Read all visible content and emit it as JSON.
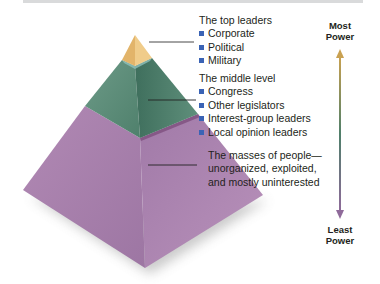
{
  "diagram": {
    "type": "power-elite-pyramid",
    "tiers": [
      {
        "id": "top",
        "heading": "The top leaders",
        "items": [
          "Corporate",
          "Political",
          "Military"
        ],
        "color": "#d9a85a"
      },
      {
        "id": "middle",
        "heading": "The middle level",
        "items": [
          "Congress",
          "Other legislators",
          "Interest-group leaders",
          "Local opinion leaders"
        ],
        "color": "#5b8b78"
      },
      {
        "id": "bottom",
        "heading_lines": [
          "The masses of people—",
          "unorganized, exploited,",
          "and mostly uninterested"
        ],
        "color": "#a981ad"
      }
    ],
    "power_axis": {
      "top_label_line1": "Most",
      "top_label_line2": "Power",
      "bottom_label_line1": "Least",
      "bottom_label_line2": "Power",
      "gradient": [
        "#c9a151",
        "#4f7f6a",
        "#8f6a9a"
      ]
    },
    "bullet_color": "#3a63b5"
  }
}
